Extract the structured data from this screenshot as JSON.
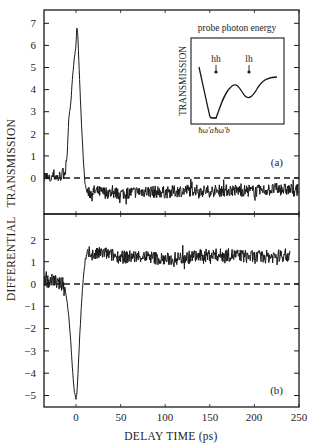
{
  "chart_data": [
    {
      "type": "line",
      "panel_label": "(a)",
      "title": "",
      "xlabel": "DELAY TIME (ps)",
      "ylabel": "DIFFERENTIAL TRANSMISSION",
      "xlim": [
        -36,
        250
      ],
      "ylim": [
        -1.6,
        7.5
      ],
      "yticks": [
        0,
        1,
        2,
        3,
        4,
        5,
        6,
        7
      ],
      "xticks": [
        0,
        50,
        100,
        150,
        200,
        250
      ],
      "grid": false,
      "reference_line": {
        "y": 0,
        "style": "dashed"
      },
      "series": [
        {
          "name": "differential transmission (a)",
          "x": [
            -35,
            -30,
            -25,
            -20,
            -15,
            -12,
            -10,
            -8,
            -6,
            -4,
            -2,
            0,
            1,
            2,
            3,
            4,
            6,
            8,
            10,
            12,
            15,
            20,
            30,
            50,
            75,
            100,
            125,
            150,
            175,
            200,
            225,
            248
          ],
          "y": [
            0.1,
            -0.1,
            0.15,
            0.0,
            0.2,
            0.3,
            1.0,
            2.8,
            3.3,
            4.5,
            5.4,
            6.0,
            6.9,
            6.5,
            5.5,
            4.5,
            2.6,
            1.0,
            -0.2,
            -0.6,
            -0.7,
            -0.6,
            -0.65,
            -0.7,
            -0.6,
            -0.65,
            -0.55,
            -0.6,
            -0.55,
            -0.6,
            -0.5,
            -0.55
          ]
        }
      ],
      "inset": {
        "title": "probe photon energy",
        "ylabel": "TRANSMISSION",
        "annotations": [
          "hh",
          "lh"
        ],
        "x_tick_labels": [
          "ħω'a",
          "ħω'b"
        ],
        "curve_description": "transmission vs probe photon energy: steep drop to minimum near ħω'a–ħω'b, rise to local max, dip at lh, then rise"
      }
    },
    {
      "type": "line",
      "panel_label": "(b)",
      "title": "",
      "xlabel": "DELAY TIME (ps)",
      "ylabel": "DIFFERENTIAL TRANSMISSION",
      "xlim": [
        -36,
        250
      ],
      "ylim": [
        -5.5,
        2.8
      ],
      "yticks": [
        2,
        1,
        0,
        -1,
        -2,
        -3,
        -4,
        -5
      ],
      "xticks": [
        0,
        50,
        100,
        150,
        200,
        250
      ],
      "grid": false,
      "reference_line": {
        "y": 0,
        "style": "dashed"
      },
      "series": [
        {
          "name": "differential transmission (b)",
          "x": [
            -35,
            -30,
            -25,
            -20,
            -15,
            -12,
            -10,
            -8,
            -6,
            -4,
            -2,
            0,
            1,
            2,
            4,
            6,
            8,
            10,
            12,
            15,
            20,
            30,
            50,
            75,
            100,
            125,
            150,
            175,
            200,
            225,
            240
          ],
          "y": [
            0.2,
            0.1,
            0.2,
            0.0,
            0.0,
            -0.3,
            -0.8,
            -1.5,
            -2.5,
            -3.8,
            -4.8,
            -5.2,
            -4.9,
            -4.2,
            -2.5,
            -1.0,
            0.2,
            0.9,
            1.2,
            1.4,
            1.3,
            1.4,
            1.2,
            1.25,
            1.1,
            1.2,
            1.3,
            1.3,
            1.2,
            1.25,
            1.3
          ]
        }
      ]
    }
  ],
  "labels": {
    "ylabel": "DIFFERENTIAL   TRANSMISSION",
    "xlabel": "DELAY TIME (ps)",
    "panel_a": "(a)",
    "panel_b": "(b)",
    "inset_title": "probe photon energy",
    "inset_ylabel": "TRANSMISSION",
    "inset_hh": "hh",
    "inset_lh": "lh",
    "inset_tick_a": "ħω'a",
    "inset_tick_b": "ħω'b"
  },
  "ticks": {
    "x": [
      "0",
      "50",
      "100",
      "150",
      "200",
      "250"
    ],
    "ya": [
      "0",
      "1",
      "2",
      "3",
      "4",
      "5",
      "6",
      "7"
    ],
    "yb": [
      "2",
      "1",
      "0",
      "−1",
      "−2",
      "−3",
      "−4",
      "−5"
    ]
  },
  "colors": {
    "ink": "#1a1a1a",
    "background": "#ffffff"
  }
}
